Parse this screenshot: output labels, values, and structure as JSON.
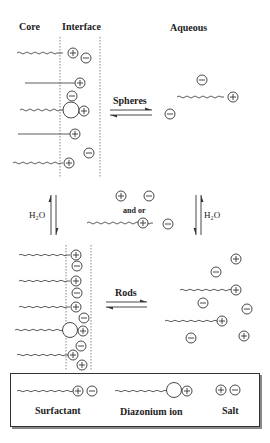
{
  "diagram": {
    "headers": {
      "core": "Core",
      "interface": "Interface",
      "aqueous": "Aqueous"
    },
    "arrows": {
      "top_horizontal_label": "Spheres",
      "bottom_horizontal_label": "Rods",
      "left_vertical_label": "H₂O",
      "right_vertical_label": "H₂O",
      "middle_connector_label": "and or"
    },
    "legend": {
      "items": [
        {
          "label": "Surfactant",
          "symbol": "tail + cation + anion"
        },
        {
          "label": "Diazonium ion",
          "symbol": "tail + large head + cation"
        },
        {
          "label": "Salt",
          "symbol": "cation + anion"
        }
      ]
    },
    "symbols": {
      "cation": "+",
      "anion": "−"
    },
    "colors": {
      "line": "#333333",
      "background": "#ffffff",
      "shadow": "#888888"
    }
  }
}
